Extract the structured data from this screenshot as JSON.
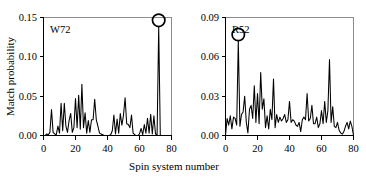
{
  "figure": {
    "xlabel": "Spin system number",
    "ylabel": "Match probability"
  },
  "chart_data": [
    {
      "type": "line",
      "title": "W72",
      "panel_tag": "W72",
      "xlabel": "Spin system number",
      "ylabel": "Match probability",
      "xlim": [
        0,
        80
      ],
      "ylim": [
        0.0,
        0.15
      ],
      "xticks": [
        0,
        20,
        40,
        60,
        80
      ],
      "xtick_labels": [
        "0",
        "20",
        "40",
        "60",
        "80"
      ],
      "yticks": [
        0.0,
        0.05,
        0.1,
        0.15
      ],
      "ytick_labels": [
        "0.00",
        "0.05",
        "0.10",
        "0.15"
      ],
      "grid": false,
      "legend": "none",
      "annotations": [
        {
          "type": "circle-marker",
          "x": 72,
          "y": 0.138,
          "label": "highlighted-peak"
        }
      ],
      "x": [
        1,
        2,
        3,
        4,
        5,
        6,
        7,
        8,
        9,
        10,
        11,
        12,
        13,
        14,
        15,
        16,
        17,
        18,
        19,
        20,
        21,
        22,
        23,
        24,
        25,
        26,
        27,
        28,
        29,
        30,
        31,
        32,
        33,
        34,
        35,
        36,
        37,
        38,
        39,
        40,
        41,
        42,
        43,
        44,
        45,
        46,
        47,
        48,
        49,
        50,
        51,
        52,
        53,
        54,
        55,
        56,
        57,
        58,
        59,
        60,
        61,
        62,
        63,
        64,
        65,
        66,
        67,
        68,
        69,
        70,
        71,
        72,
        73,
        74,
        75,
        76,
        77,
        78,
        79
      ],
      "values": [
        0.0,
        0.002,
        0.001,
        0.004,
        0.033,
        0.004,
        0.002,
        0.001,
        0.012,
        0.003,
        0.041,
        0.006,
        0.041,
        0.012,
        0.004,
        0.019,
        0.028,
        0.004,
        0.01,
        0.047,
        0.01,
        0.051,
        0.008,
        0.065,
        0.01,
        0.029,
        0.003,
        0.019,
        0.004,
        0.02,
        0.02,
        0.046,
        0.02,
        0.012,
        0.003,
        0.002,
        0.001,
        0.0,
        0.0,
        0.0,
        0.0,
        0.001,
        0.006,
        0.026,
        0.002,
        0.021,
        0.003,
        0.028,
        0.013,
        0.026,
        0.048,
        0.015,
        0.014,
        0.01,
        0.026,
        0.003,
        0.001,
        0.0,
        0.0,
        0.002,
        0.009,
        0.001,
        0.014,
        0.003,
        0.022,
        0.003,
        0.027,
        0.002,
        0.025,
        0.002,
        0.001,
        0.138,
        0.0,
        0.0,
        0.0,
        0.0,
        0.0,
        0.0,
        0.0
      ]
    },
    {
      "type": "line",
      "title": "R52",
      "panel_tag": "R52",
      "xlabel": "Spin system number",
      "ylabel": "Match probability",
      "xlim": [
        0,
        80
      ],
      "ylim": [
        0.0,
        0.09
      ],
      "xticks": [
        0,
        20,
        40,
        60,
        80
      ],
      "xtick_labels": [
        "0",
        "20",
        "40",
        "60",
        "80"
      ],
      "yticks": [
        0.0,
        0.03,
        0.06,
        0.09
      ],
      "ytick_labels": [
        "0.00",
        "0.03",
        "0.06",
        "0.09"
      ],
      "grid": false,
      "legend": "none",
      "annotations": [
        {
          "type": "circle-marker",
          "x": 8,
          "y": 0.072,
          "label": "highlighted-peak"
        }
      ],
      "x": [
        1,
        2,
        3,
        4,
        5,
        6,
        7,
        8,
        9,
        10,
        11,
        12,
        13,
        14,
        15,
        16,
        17,
        18,
        19,
        20,
        21,
        22,
        23,
        24,
        25,
        26,
        27,
        28,
        29,
        30,
        31,
        32,
        33,
        34,
        35,
        36,
        37,
        38,
        39,
        40,
        41,
        42,
        43,
        44,
        45,
        46,
        47,
        48,
        49,
        50,
        51,
        52,
        53,
        54,
        55,
        56,
        57,
        58,
        59,
        60,
        61,
        62,
        63,
        64,
        65,
        66,
        67,
        68,
        69,
        70,
        71,
        72,
        73,
        74,
        75,
        76,
        77,
        78,
        79
      ],
      "values": [
        0.013,
        0.008,
        0.015,
        0.005,
        0.014,
        0.013,
        0.008,
        0.072,
        0.007,
        0.016,
        0.018,
        0.03,
        0.01,
        0.002,
        0.02,
        0.023,
        0.013,
        0.038,
        0.01,
        0.032,
        0.009,
        0.048,
        0.02,
        0.028,
        0.006,
        0.015,
        0.005,
        0.02,
        0.012,
        0.043,
        0.006,
        0.016,
        0.01,
        0.014,
        0.011,
        0.013,
        0.016,
        0.01,
        0.012,
        0.026,
        0.01,
        0.012,
        0.011,
        0.008,
        0.007,
        0.01,
        0.003,
        0.012,
        0.014,
        0.012,
        0.032,
        0.011,
        0.013,
        0.023,
        0.009,
        0.009,
        0.014,
        0.006,
        0.009,
        0.019,
        0.009,
        0.026,
        0.01,
        0.019,
        0.058,
        0.01,
        0.022,
        0.007,
        0.006,
        0.01,
        0.004,
        0.002,
        0.001,
        0.003,
        0.007,
        0.01,
        0.005,
        0.011,
        0.007
      ]
    }
  ]
}
